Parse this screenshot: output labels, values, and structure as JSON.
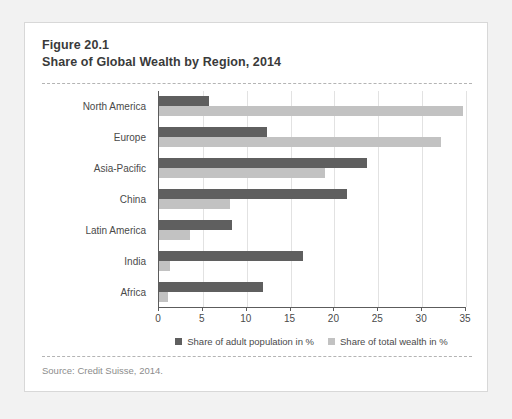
{
  "figure": {
    "title_line_1": "Figure 20.1",
    "title_line_2": "Share of Global Wealth by Region, 2014",
    "source": "Source: Credit Suisse, 2014."
  },
  "colors": {
    "population_series": "#5f5f5f",
    "wealth_series": "#c2c2c2",
    "axis": "#5c5c5c",
    "gridline": "#e2e2e2",
    "card_background": "#ffffff",
    "page_background": "#f2f2f2"
  },
  "chart_data": {
    "type": "bar",
    "orientation": "horizontal",
    "title": "Share of Global Wealth by Region, 2014",
    "xlabel": "",
    "ylabel": "",
    "xlim": [
      0,
      35
    ],
    "xticks": [
      0,
      5,
      10,
      15,
      20,
      25,
      30,
      35
    ],
    "xtick_labels": [
      "0",
      "5",
      "10",
      "15",
      "20",
      "25",
      "30",
      "35"
    ],
    "grid": true,
    "legend_position": "bottom-center",
    "categories": [
      "North America",
      "Europe",
      "Asia-Pacific",
      "China",
      "Latin America",
      "India",
      "Africa"
    ],
    "series": [
      {
        "name": "Share of adult population in %",
        "color": "#5f5f5f",
        "values": [
          5.7,
          12.3,
          23.7,
          21.4,
          8.3,
          16.4,
          11.8
        ]
      },
      {
        "name": "Share of total wealth in %",
        "color": "#c2c2c2",
        "values": [
          34.7,
          32.2,
          18.9,
          8.1,
          3.5,
          1.2,
          1.0
        ]
      }
    ]
  }
}
